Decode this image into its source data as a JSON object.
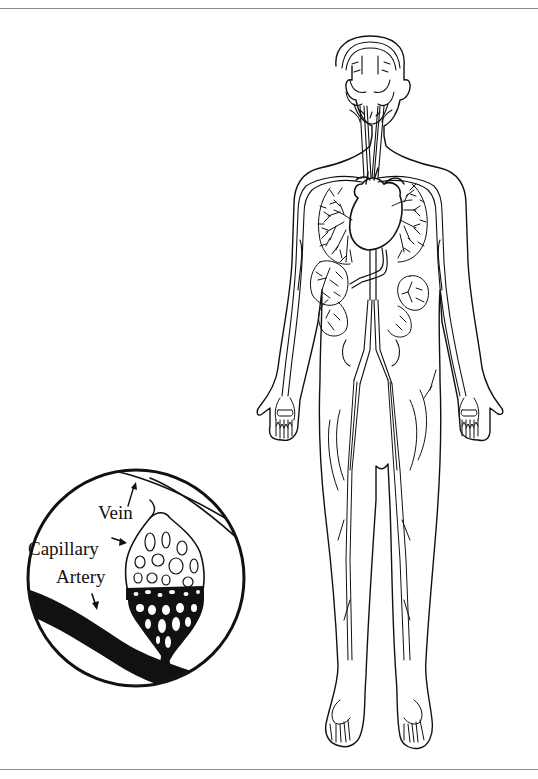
{
  "figure": {
    "inset": {
      "labels": {
        "vein": "Vein",
        "capillary": "Capillary",
        "artery": "Artery"
      }
    },
    "colors": {
      "line": "#111111",
      "background": "#ffffff",
      "frame": "#8a8a8a"
    }
  }
}
